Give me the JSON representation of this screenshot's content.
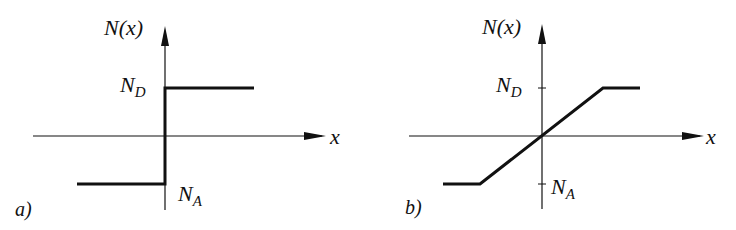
{
  "figure": {
    "panels": [
      {
        "id": "a",
        "panel_label": "a)",
        "y_axis_label": "N(x)",
        "x_axis_label": "x",
        "upper_level_label": {
          "main": "N",
          "sub": "D"
        },
        "lower_level_label": {
          "main": "N",
          "sub": "A"
        },
        "profile": "abrupt step"
      },
      {
        "id": "b",
        "panel_label": "b)",
        "y_axis_label": "N(x)",
        "x_axis_label": "x",
        "upper_level_label": {
          "main": "N",
          "sub": "D"
        },
        "lower_level_label": {
          "main": "N",
          "sub": "A"
        },
        "profile": "linear graded ramp"
      }
    ],
    "colors": {
      "ink": "#111111",
      "background": "#ffffff"
    }
  }
}
